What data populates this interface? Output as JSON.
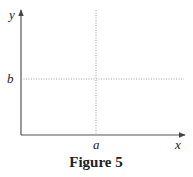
{
  "figure": {
    "caption": "Figure 5",
    "axes": {
      "x_label": "x",
      "y_label": "y"
    },
    "markers": {
      "x_marker": "a",
      "y_marker": "b"
    },
    "lines": [
      {
        "type": "vertical-dotted",
        "at": "a"
      },
      {
        "type": "horizontal-dotted",
        "at": "b"
      }
    ]
  }
}
